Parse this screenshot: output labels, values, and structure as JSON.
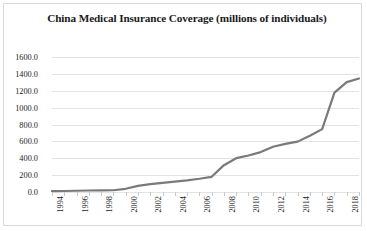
{
  "chart_data": {
    "type": "line",
    "title": "China Medical Insurance Coverage (millions of individuals)",
    "xlabel": "",
    "ylabel": "",
    "grid": true,
    "legend": false,
    "line_color": "#7a7a7a",
    "gridline_color": "#e3e3e3",
    "xlim": [
      1994,
      2019
    ],
    "ylim": [
      0,
      1600
    ],
    "ytick_step": 200,
    "ytick_labels": [
      "0.0",
      "200.0",
      "400.0",
      "600.0",
      "800.0",
      "1000.0",
      "1200.0",
      "1400.0",
      "1600.0"
    ],
    "ytick_values": [
      0,
      200,
      400,
      600,
      800,
      1000,
      1200,
      1400,
      1600
    ],
    "xtick_labels": [
      "1994",
      "1996",
      "1998",
      "2000",
      "2002",
      "2004",
      "2006",
      "2008",
      "2010",
      "2012",
      "2014",
      "2016",
      "2018"
    ],
    "x": [
      1994,
      1995,
      1996,
      1997,
      1998,
      1999,
      2000,
      2001,
      2002,
      2003,
      2004,
      2005,
      2006,
      2007,
      2008,
      2009,
      2010,
      2011,
      2012,
      2013,
      2014,
      2015,
      2016,
      2017,
      2018,
      2019
    ],
    "values": [
      10,
      12,
      15,
      18,
      19,
      21,
      38,
      73,
      94,
      109,
      124,
      138,
      157,
      180,
      318,
      401,
      433,
      473,
      536,
      570,
      597,
      666,
      745,
      1177,
      1302,
      1345
    ],
    "series": [
      {
        "name": "China Medical Insurance Coverage",
        "values": [
          10,
          12,
          15,
          18,
          19,
          21,
          38,
          73,
          94,
          109,
          124,
          138,
          157,
          180,
          318,
          401,
          433,
          473,
          536,
          570,
          597,
          666,
          745,
          1177,
          1302,
          1345
        ]
      }
    ]
  }
}
